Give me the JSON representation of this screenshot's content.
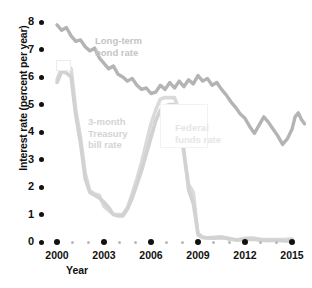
{
  "chart_data": {
    "type": "line",
    "title": "",
    "xlabel": "Year",
    "ylabel": "Interest rate (percent per year)",
    "xlim": [
      1999.6,
      2015.6
    ],
    "ylim": [
      0,
      8.4
    ],
    "grid": false,
    "legend": "inline-annotations",
    "xticks": [
      2000,
      2003,
      2006,
      2009,
      2012,
      2015
    ],
    "xtick_labels": [
      "2000",
      "2003",
      "2006",
      "2009",
      "2012",
      "2015"
    ],
    "xminor_ticks": [
      2001,
      2002,
      2004,
      2005,
      2007,
      2008,
      2010,
      2011,
      2013,
      2014
    ],
    "yticks": [
      0,
      1,
      2,
      3,
      4,
      5,
      6,
      7,
      8
    ],
    "ytick_labels": [
      "0",
      "1",
      "2",
      "3",
      "4",
      "5",
      "6",
      "7",
      "8"
    ],
    "series": [
      {
        "name": "Long-term bond rate",
        "color": "#b4b4b4",
        "label_color": "#c9c9c9",
        "x": [
          2000.0,
          2000.3,
          2000.6,
          2000.9,
          2001.2,
          2001.5,
          2001.8,
          2002.1,
          2002.4,
          2002.7,
          2003.0,
          2003.3,
          2003.6,
          2003.9,
          2004.2,
          2004.5,
          2004.8,
          2005.1,
          2005.4,
          2005.7,
          2006.0,
          2006.3,
          2006.6,
          2006.9,
          2007.2,
          2007.5,
          2007.8,
          2008.1,
          2008.4,
          2008.7,
          2009.0,
          2009.3,
          2009.6,
          2009.9,
          2010.2,
          2010.5,
          2010.8,
          2011.1,
          2011.4,
          2011.7,
          2012.0,
          2012.3,
          2012.6,
          2012.9,
          2013.2,
          2013.5,
          2013.8,
          2014.1,
          2014.4,
          2014.7,
          2015.0
        ],
        "values": [
          7.9,
          7.7,
          7.8,
          7.5,
          7.3,
          7.35,
          7.1,
          6.95,
          7.05,
          6.7,
          6.5,
          6.3,
          6.4,
          6.1,
          6.0,
          5.85,
          5.95,
          5.7,
          5.55,
          5.6,
          5.4,
          5.45,
          5.7,
          5.55,
          5.8,
          5.6,
          5.85,
          5.65,
          5.9,
          5.75,
          6.05,
          5.85,
          5.95,
          5.7,
          5.8,
          5.55,
          5.35,
          5.1,
          4.9,
          4.65,
          4.5,
          4.2,
          3.95,
          4.25,
          4.55,
          4.35,
          4.1,
          3.85,
          3.55,
          3.75,
          4.1
        ],
        "values_tail": [
          4.55,
          4.7,
          4.45,
          4.3
        ]
      },
      {
        "name": "3-month Treasury bill rate",
        "color": "#d2d2d2",
        "label_color": "#dcdcdc",
        "x": [
          2000.0,
          2000.3,
          2000.6,
          2000.9,
          2001.2,
          2001.5,
          2001.8,
          2002.1,
          2002.4,
          2002.7,
          2003.0,
          2003.3,
          2003.6,
          2003.9,
          2004.2,
          2004.5,
          2004.8,
          2005.1,
          2005.4,
          2005.7,
          2006.0,
          2006.3,
          2006.6,
          2006.9,
          2007.2,
          2007.5,
          2007.8,
          2008.1,
          2008.4,
          2008.7,
          2009.0,
          2009.3,
          2009.6,
          2010.0,
          2010.5,
          2011.0,
          2011.5,
          2012.0,
          2012.5,
          2013.0,
          2013.5,
          2014.0,
          2014.5,
          2015.0
        ],
        "values": [
          5.8,
          6.2,
          6.15,
          6.0,
          4.6,
          3.6,
          2.3,
          1.8,
          1.7,
          1.6,
          1.45,
          1.25,
          1.0,
          0.95,
          0.95,
          1.2,
          1.6,
          2.1,
          2.6,
          3.2,
          3.8,
          4.4,
          4.8,
          4.95,
          5.0,
          5.0,
          4.6,
          3.3,
          1.9,
          1.4,
          0.3,
          0.18,
          0.15,
          0.14,
          0.16,
          0.13,
          0.06,
          0.09,
          0.1,
          0.07,
          0.05,
          0.06,
          0.04,
          0.03
        ]
      },
      {
        "name": "Federal funds rate",
        "color": "#dadada",
        "label_color": "#e4e4e4",
        "x": [
          2000.0,
          2000.3,
          2000.6,
          2000.9,
          2001.2,
          2001.5,
          2001.8,
          2002.1,
          2002.4,
          2002.7,
          2003.0,
          2003.3,
          2003.6,
          2003.9,
          2004.2,
          2004.5,
          2004.8,
          2005.1,
          2005.4,
          2005.7,
          2006.0,
          2006.3,
          2006.6,
          2006.9,
          2007.2,
          2007.5,
          2007.8,
          2008.1,
          2008.4,
          2008.7,
          2009.0,
          2009.3,
          2009.6,
          2010.0,
          2010.5,
          2011.0,
          2011.5,
          2012.0,
          2012.5,
          2013.0,
          2013.5,
          2014.0,
          2014.5,
          2015.0
        ],
        "values": [
          5.9,
          6.35,
          6.45,
          6.3,
          4.8,
          3.8,
          2.5,
          1.85,
          1.75,
          1.7,
          1.3,
          1.15,
          1.0,
          1.0,
          1.0,
          1.25,
          1.75,
          2.3,
          2.9,
          3.6,
          4.3,
          4.8,
          5.2,
          5.25,
          5.25,
          5.25,
          4.8,
          3.2,
          2.1,
          1.8,
          0.25,
          0.16,
          0.15,
          0.17,
          0.19,
          0.1,
          0.08,
          0.14,
          0.15,
          0.1,
          0.09,
          0.09,
          0.09,
          0.12
        ]
      }
    ],
    "annotations": [
      {
        "name": "long-term-bond-rate-label",
        "text": "Long-term\nbond rate",
        "x_px": 95,
        "y_px": 35,
        "color": "#c4c4c4"
      },
      {
        "name": "three-month-treasury-bill-rate-label",
        "text": "3-month\nTreasury\nbill rate",
        "x_px": 88,
        "y_px": 116,
        "color": "#d4d4d4"
      },
      {
        "name": "federal-funds-rate-label",
        "text": "Federal\nfunds rate",
        "x_px": 175,
        "y_px": 122,
        "color": "#e6e6e6"
      }
    ]
  },
  "axis": {
    "y_title": "Interest rate (percent per year)",
    "x_title": "Year"
  },
  "colors": {
    "axis_text": "#111111",
    "tick_major": "#111111",
    "tick_minor": "#b9b9b9",
    "background": "#ffffff"
  }
}
